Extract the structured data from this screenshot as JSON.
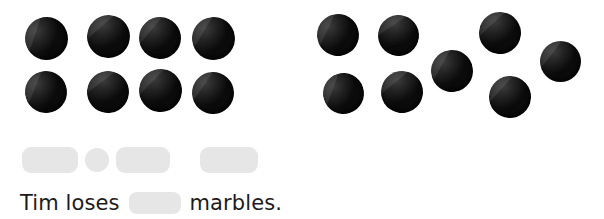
{
  "page": {
    "width": 604,
    "height": 219,
    "background_color": "#ffffff",
    "blank_color": "#e6e6e6",
    "marble_color": "#0d0d0d"
  },
  "marble_groups": [
    {
      "name": "left-group",
      "count": 8,
      "arrangement": "2 rows of 4",
      "marbles": [
        {
          "cx": 46,
          "cy": 38,
          "d": 43
        },
        {
          "cx": 108,
          "cy": 36,
          "d": 43
        },
        {
          "cx": 160,
          "cy": 38,
          "d": 42
        },
        {
          "cx": 213,
          "cy": 38,
          "d": 43
        },
        {
          "cx": 46,
          "cy": 92,
          "d": 42
        },
        {
          "cx": 108,
          "cy": 92,
          "d": 42
        },
        {
          "cx": 160,
          "cy": 90,
          "d": 43
        },
        {
          "cx": 213,
          "cy": 93,
          "d": 42
        }
      ]
    },
    {
      "name": "right-group",
      "count": 8,
      "arrangement": "scattered",
      "marbles": [
        {
          "cx": 338,
          "cy": 35,
          "d": 42
        },
        {
          "cx": 398,
          "cy": 35,
          "d": 41
        },
        {
          "cx": 500,
          "cy": 33,
          "d": 42
        },
        {
          "cx": 560,
          "cy": 61,
          "d": 41
        },
        {
          "cx": 452,
          "cy": 71,
          "d": 42
        },
        {
          "cx": 343,
          "cy": 93,
          "d": 41
        },
        {
          "cx": 402,
          "cy": 92,
          "d": 42
        },
        {
          "cx": 510,
          "cy": 97,
          "d": 42
        }
      ]
    }
  ],
  "equation": {
    "operator_label": "=",
    "fields": [
      {
        "name": "minuend",
        "value": "",
        "x": 22,
        "y": 147,
        "w": 56,
        "h": 26,
        "shape": "rounded"
      },
      {
        "name": "operator",
        "value": "",
        "x": 85,
        "y": 148,
        "w": 24,
        "h": 24,
        "shape": "circle"
      },
      {
        "name": "subtrahend",
        "value": "",
        "x": 116,
        "y": 147,
        "w": 54,
        "h": 26,
        "shape": "rounded"
      },
      {
        "name": "difference",
        "value": "",
        "x": 200,
        "y": 147,
        "w": 58,
        "h": 26,
        "shape": "rounded"
      }
    ]
  },
  "sentence": {
    "prefix": "Tim loses",
    "answer_value": "",
    "suffix": "marbles."
  }
}
